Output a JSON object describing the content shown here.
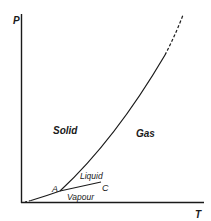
{
  "diagram": {
    "type": "phase-diagram",
    "axes": {
      "y_label": "P",
      "x_label": "T"
    },
    "regions": {
      "solid": "Solid",
      "gas": "Gas",
      "liquid": "Liquid",
      "vapour": "Vapour"
    },
    "points": {
      "triple": "A",
      "critical": "C"
    },
    "colors": {
      "line": "#1a1a1a",
      "background": "#ffffff"
    }
  }
}
